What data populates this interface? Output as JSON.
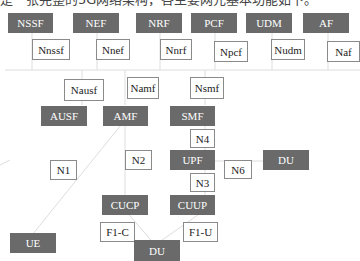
{
  "caption": "是一张完整的5G网络架构，各主要网元基本功能如下。",
  "colors": {
    "node_fill": "#6a6a6a",
    "interface_border": "#8a8a8a",
    "line": "#dddddd"
  },
  "network_functions": {
    "nssf": "NSSF",
    "nef": "NEF",
    "nrf": "NRF",
    "pcf": "PCF",
    "udm": "UDM",
    "af": "AF",
    "ausf": "AUSF",
    "amf": "AMF",
    "smf": "SMF",
    "upf": "UPF",
    "du_right": "DU",
    "cucp": "CUCP",
    "cuup": "CUUP",
    "du_bottom": "DU",
    "ue": "UE"
  },
  "interfaces": {
    "nnssf": "Nnssf",
    "nnef": "Nnef",
    "nnrf": "Nnrf",
    "npcf": "Npcf",
    "nudm": "Nudm",
    "naf": "Naf",
    "nausf": "Nausf",
    "namf": "Namf",
    "nsmf": "Nsmf",
    "n1": "N1",
    "n2": "N2",
    "n3": "N3",
    "n4": "N4",
    "n6": "N6",
    "f1c": "F1-C",
    "f1u": "F1-U"
  }
}
